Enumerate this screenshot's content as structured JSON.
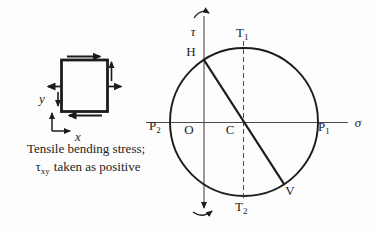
{
  "colors": {
    "ink": "#1c1c1c",
    "axis": "#4a4a4a",
    "background": "#fdfdfd"
  },
  "stress_element": {
    "x_axis_label": "x",
    "y_axis_label": "y",
    "caption": {
      "line1": "Tensile bending stress;",
      "tau": "τ",
      "tau_subscript": "xy",
      "line2_rest": "taken as positive"
    }
  },
  "mohr_circle": {
    "tau_axis_label": "τ",
    "sigma_axis_label": "σ",
    "labels": {
      "H": "H",
      "V": "V",
      "O": "O",
      "C": "C",
      "T1_base": "T",
      "T1_sub": "1",
      "T2_base": "T",
      "T2_sub": "2",
      "P1_base": "P",
      "P1_sub": "1",
      "P2_base": "P",
      "P2_sub": "2"
    }
  }
}
